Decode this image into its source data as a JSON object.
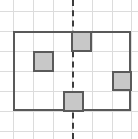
{
  "figure": {
    "canvas": {
      "width": 138,
      "height": 139,
      "background": "#ffffff"
    },
    "grid": {
      "line_color": "#dcdcdc",
      "spacing": 19.8,
      "vertical_x": [
        13,
        33,
        53,
        72,
        92,
        112,
        131
      ],
      "horizontal_y": [
        11,
        31,
        51,
        71,
        91,
        111,
        131
      ]
    },
    "outline": {
      "label": "main rectangle",
      "x": 13,
      "y": 31,
      "width": 118,
      "height": 80,
      "stroke_color": "#595959",
      "stroke_width": 2,
      "columns": 6,
      "rows": 4
    },
    "symmetry_axis": {
      "label": "vertical dashed line of symmetry",
      "orientation": "vertical",
      "x": 72,
      "y": 0,
      "length": 139,
      "stroke_color": "#3c3c3c",
      "style": "dashed"
    },
    "shaded_squares": [
      {
        "label": "top shaded square",
        "x": 71,
        "y": 31,
        "size": 21,
        "fill": "#c8c8c8",
        "stroke": "#5a5a5a"
      },
      {
        "label": "left shaded square",
        "x": 33,
        "y": 51,
        "size": 21,
        "fill": "#c8c8c8",
        "stroke": "#5a5a5a"
      },
      {
        "label": "right shaded square",
        "x": 112,
        "y": 71,
        "size": 20,
        "fill": "#c8c8c8",
        "stroke": "#5a5a5a"
      },
      {
        "label": "bottom shaded square",
        "x": 63,
        "y": 91,
        "size": 21,
        "fill": "#c8c8c8",
        "stroke": "#5a5a5a"
      }
    ]
  }
}
